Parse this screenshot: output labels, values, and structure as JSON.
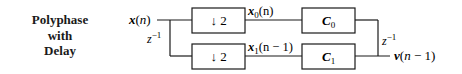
{
  "title": {
    "line1": "Polyphase",
    "line2": "with",
    "line3": "Delay"
  },
  "diagram": {
    "input_label": "x(n)",
    "input_delay": "z",
    "input_delay_exp": "−1",
    "branch0": {
      "downsampler": "↓ 2",
      "signal_label": "x",
      "signal_sub": "0",
      "signal_arg": "(n)",
      "filter": "C",
      "filter_sub": "0"
    },
    "branch1": {
      "downsampler": "↓ 2",
      "signal_label": "x",
      "signal_sub": "1",
      "signal_arg": "(n − 1)",
      "filter": "C",
      "filter_sub": "1"
    },
    "output_delay": "z",
    "output_delay_exp": "−1",
    "output_label": "v(n − 1)"
  }
}
